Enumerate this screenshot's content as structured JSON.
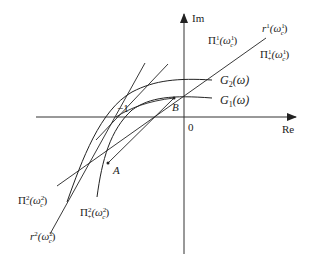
{
  "axes": {
    "x_label": "Re",
    "y_label": "Im",
    "origin_label": "0",
    "minus_one_label": "−1"
  },
  "points": {
    "A": "A",
    "B": "B"
  },
  "curves": {
    "G1": {
      "name": "G",
      "sub": "1",
      "arg": "(ω)"
    },
    "G2": {
      "name": "G",
      "sub": "2",
      "arg": "(ω)"
    }
  },
  "lines": {
    "r1": {
      "name": "r",
      "sup": "1",
      "arg_open": "(ω",
      "arg_sup": "1",
      "arg_sub": "c",
      "arg_close": ")"
    },
    "pi1_minus": {
      "name": "Π",
      "sup": "1",
      "sub": "−",
      "arg_open": "(ω",
      "arg_sup": "1",
      "arg_sub": "c",
      "arg_close": ")"
    },
    "pi1_plus": {
      "name": "Π",
      "sup": "1",
      "sub": "+",
      "arg_open": "(ω",
      "arg_sup": "1",
      "arg_sub": "c",
      "arg_close": ")"
    },
    "r2": {
      "name": "r",
      "sup": "2",
      "arg_open": "(ω",
      "arg_sup": "2",
      "arg_sub": "c",
      "arg_close": ")"
    },
    "pi2_minus": {
      "name": "Π",
      "sup": "2",
      "sub": "−",
      "arg_open": "(ω",
      "arg_sup": "2",
      "arg_sub": "c",
      "arg_close": ")"
    },
    "pi2_plus": {
      "name": "Π",
      "sup": "2",
      "sub": "+",
      "arg_open": "(ω",
      "arg_sup": "2",
      "arg_sub": "c",
      "arg_close": ")"
    }
  }
}
